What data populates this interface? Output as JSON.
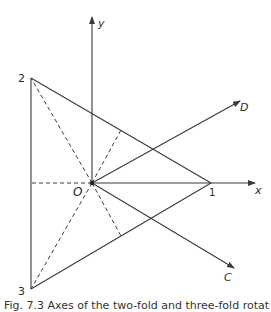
{
  "figure": {
    "axes": {
      "x_label": "x",
      "y_label": "y"
    },
    "origin_label": "O",
    "vertices": [
      {
        "id": "1",
        "label": "1"
      },
      {
        "id": "2",
        "label": "2"
      },
      {
        "id": "3",
        "label": "3"
      }
    ],
    "rays": [
      {
        "id": "D",
        "label": "D"
      },
      {
        "id": "C",
        "label": "C"
      }
    ],
    "stroke_color": "#3a3a3a",
    "caption": "Fig. 7.3  Axes of the two-fold and three-fold rotations of D3"
  }
}
